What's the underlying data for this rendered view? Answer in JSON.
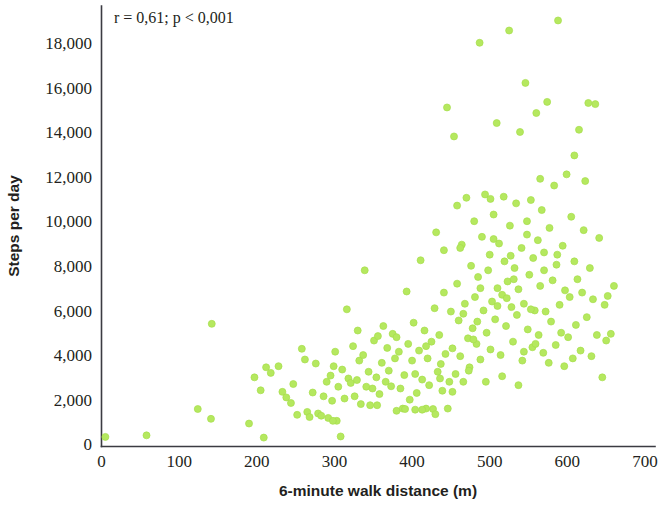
{
  "figure": {
    "background_color": "#ffffff",
    "point_color": "#b5e85f",
    "point_edge_color": "#a6de4b",
    "axis_color": "#3b3b42"
  },
  "annotation": {
    "text": "r = 0,61; p < 0,001"
  },
  "chart_data": {
    "type": "scatter",
    "title": "",
    "xlabel": "6-minute walk distance (m)",
    "ylabel": "Steps per day",
    "xlim": [
      0,
      700
    ],
    "ylim": [
      0,
      19600
    ],
    "xticks": [
      0,
      100,
      200,
      300,
      400,
      500,
      600,
      700
    ],
    "xtick_labels": [
      "0",
      "100",
      "200",
      "300",
      "400",
      "500",
      "600",
      "700"
    ],
    "yticks": [
      0,
      2000,
      4000,
      6000,
      8000,
      10000,
      12000,
      14000,
      16000,
      18000
    ],
    "ytick_labels": [
      "0",
      "2,000",
      "4,000",
      "6,000",
      "8,000",
      "10,000",
      "12,000",
      "14,000",
      "16,000",
      "18,000"
    ],
    "grid": false,
    "legend": false,
    "annotations": [
      {
        "text": "r = 0,61; p < 0,001",
        "x": 30,
        "y": 19200
      }
    ],
    "marker_size": 7,
    "series": [
      {
        "name": "participants",
        "color": "#b5e85f",
        "points": [
          [
            5,
            430
          ],
          [
            58,
            500
          ],
          [
            124,
            1680
          ],
          [
            141,
            1240
          ],
          [
            142,
            5500
          ],
          [
            190,
            1030
          ],
          [
            197,
            3100
          ],
          [
            205,
            2520
          ],
          [
            209,
            400
          ],
          [
            212,
            3550
          ],
          [
            218,
            3300
          ],
          [
            228,
            3600
          ],
          [
            233,
            2450
          ],
          [
            238,
            2200
          ],
          [
            244,
            1950
          ],
          [
            247,
            2800
          ],
          [
            252,
            1420
          ],
          [
            258,
            4380
          ],
          [
            262,
            3900
          ],
          [
            265,
            1550
          ],
          [
            268,
            1320
          ],
          [
            272,
            2420
          ],
          [
            276,
            3720
          ],
          [
            279,
            1480
          ],
          [
            283,
            1380
          ],
          [
            286,
            2250
          ],
          [
            290,
            2900
          ],
          [
            292,
            1280
          ],
          [
            295,
            3180
          ],
          [
            297,
            2050
          ],
          [
            299,
            3600
          ],
          [
            301,
            4250
          ],
          [
            303,
            1150
          ],
          [
            305,
            2680
          ],
          [
            308,
            450
          ],
          [
            310,
            3450
          ],
          [
            313,
            2150
          ],
          [
            316,
            6150
          ],
          [
            318,
            3050
          ],
          [
            321,
            2850
          ],
          [
            324,
            4500
          ],
          [
            326,
            2250
          ],
          [
            329,
            2980
          ],
          [
            332,
            3850
          ],
          [
            334,
            1900
          ],
          [
            337,
            4100
          ],
          [
            339,
            7900
          ],
          [
            341,
            2680
          ],
          [
            344,
            3350
          ],
          [
            346,
            1850
          ],
          [
            349,
            2600
          ],
          [
            351,
            4750
          ],
          [
            354,
            3100
          ],
          [
            356,
            4950
          ],
          [
            358,
            2350
          ],
          [
            361,
            3750
          ],
          [
            363,
            5400
          ],
          [
            366,
            2900
          ],
          [
            368,
            4420
          ],
          [
            370,
            3400
          ],
          [
            373,
            2700
          ],
          [
            375,
            5050
          ],
          [
            378,
            3950
          ],
          [
            380,
            1600
          ],
          [
            383,
            4250
          ],
          [
            385,
            2600
          ],
          [
            388,
            1700
          ],
          [
            390,
            3200
          ],
          [
            391,
            1680
          ],
          [
            393,
            6950
          ],
          [
            395,
            4600
          ],
          [
            397,
            2100
          ],
          [
            400,
            3850
          ],
          [
            402,
            5550
          ],
          [
            404,
            1650
          ],
          [
            406,
            2400
          ],
          [
            409,
            4300
          ],
          [
            411,
            8350
          ],
          [
            413,
            3000
          ],
          [
            416,
            5200
          ],
          [
            418,
            1700
          ],
          [
            420,
            3950
          ],
          [
            422,
            2750
          ],
          [
            425,
            4700
          ],
          [
            427,
            1680
          ],
          [
            429,
            6200
          ],
          [
            431,
            9600
          ],
          [
            433,
            3350
          ],
          [
            435,
            5000
          ],
          [
            437,
            3700
          ],
          [
            439,
            2500
          ],
          [
            441,
            8800
          ],
          [
            443,
            4150
          ],
          [
            445,
            15200
          ],
          [
            446,
            1700
          ],
          [
            448,
            2900
          ],
          [
            450,
            6050
          ],
          [
            452,
            4400
          ],
          [
            454,
            13900
          ],
          [
            456,
            3250
          ],
          [
            458,
            7300
          ],
          [
            460,
            5650
          ],
          [
            462,
            4050
          ],
          [
            464,
            9050
          ],
          [
            466,
            2900
          ],
          [
            468,
            6400
          ],
          [
            470,
            11150
          ],
          [
            472,
            4850
          ],
          [
            474,
            3550
          ],
          [
            476,
            8100
          ],
          [
            478,
            5300
          ],
          [
            480,
            10100
          ],
          [
            481,
            6700
          ],
          [
            483,
            4600
          ],
          [
            485,
            7600
          ],
          [
            487,
            18100
          ],
          [
            488,
            3900
          ],
          [
            490,
            9400
          ],
          [
            492,
            6100
          ],
          [
            494,
            11300
          ],
          [
            496,
            5100
          ],
          [
            498,
            7900
          ],
          [
            500,
            8600
          ],
          [
            501,
            4350
          ],
          [
            503,
            6500
          ],
          [
            505,
            10400
          ],
          [
            507,
            5700
          ],
          [
            509,
            14500
          ],
          [
            510,
            7100
          ],
          [
            512,
            9100
          ],
          [
            514,
            4100
          ],
          [
            516,
            6800
          ],
          [
            518,
            11200
          ],
          [
            519,
            8300
          ],
          [
            521,
            5400
          ],
          [
            523,
            7400
          ],
          [
            525,
            18650
          ],
          [
            526,
            9900
          ],
          [
            528,
            6250
          ],
          [
            530,
            4700
          ],
          [
            532,
            8000
          ],
          [
            534,
            10900
          ],
          [
            535,
            5900
          ],
          [
            537,
            7050
          ],
          [
            539,
            14100
          ],
          [
            541,
            8900
          ],
          [
            542,
            3850
          ],
          [
            544,
            6400
          ],
          [
            546,
            16300
          ],
          [
            548,
            9500
          ],
          [
            549,
            5250
          ],
          [
            551,
            7700
          ],
          [
            553,
            11050
          ],
          [
            555,
            4450
          ],
          [
            556,
            8450
          ],
          [
            558,
            6100
          ],
          [
            560,
            14950
          ],
          [
            562,
            9250
          ],
          [
            563,
            5000
          ],
          [
            565,
            7200
          ],
          [
            567,
            10600
          ],
          [
            569,
            4200
          ],
          [
            570,
            8700
          ],
          [
            572,
            6050
          ],
          [
            574,
            15450
          ],
          [
            576,
            3750
          ],
          [
            577,
            9800
          ],
          [
            579,
            5600
          ],
          [
            581,
            7450
          ],
          [
            583,
            11700
          ],
          [
            585,
            4550
          ],
          [
            586,
            8150
          ],
          [
            588,
            19100
          ],
          [
            590,
            6350
          ],
          [
            592,
            5100
          ],
          [
            594,
            9000
          ],
          [
            596,
            3600
          ],
          [
            597,
            7000
          ],
          [
            599,
            12200
          ],
          [
            601,
            4900
          ],
          [
            603,
            6700
          ],
          [
            605,
            10300
          ],
          [
            607,
            3950
          ],
          [
            609,
            8300
          ],
          [
            611,
            5450
          ],
          [
            613,
            7500
          ],
          [
            615,
            14200
          ],
          [
            617,
            4300
          ],
          [
            619,
            6900
          ],
          [
            621,
            9700
          ],
          [
            623,
            11900
          ],
          [
            625,
            5800
          ],
          [
            627,
            15400
          ],
          [
            629,
            8000
          ],
          [
            631,
            4050
          ],
          [
            633,
            6600
          ],
          [
            636,
            15350
          ],
          [
            638,
            5000
          ],
          [
            641,
            9350
          ],
          [
            645,
            3100
          ],
          [
            648,
            6350
          ],
          [
            650,
            4750
          ],
          [
            652,
            6750
          ],
          [
            656,
            5050
          ],
          [
            660,
            7200
          ],
          [
            380,
            4900
          ],
          [
            404,
            3250
          ],
          [
            355,
            1850
          ],
          [
            330,
            5200
          ],
          [
            298,
            1150
          ],
          [
            466,
            5950
          ],
          [
            488,
            7100
          ],
          [
            510,
            6300
          ],
          [
            531,
            7500
          ],
          [
            553,
            6150
          ],
          [
            441,
            6900
          ],
          [
            462,
            8900
          ],
          [
            484,
            5600
          ],
          [
            505,
            9300
          ],
          [
            527,
            8550
          ],
          [
            548,
            10100
          ],
          [
            570,
            7900
          ],
          [
            418,
            4500
          ],
          [
            436,
            3050
          ],
          [
            458,
            10800
          ],
          [
            479,
            4800
          ],
          [
            501,
            11100
          ],
          [
            522,
            6650
          ],
          [
            544,
            4250
          ],
          [
            565,
            12000
          ],
          [
            587,
            8600
          ],
          [
            609,
            13050
          ],
          [
            452,
            2450
          ],
          [
            473,
            3400
          ],
          [
            495,
            2900
          ],
          [
            516,
            3150
          ],
          [
            537,
            2750
          ],
          [
            559,
            4600
          ],
          [
            413,
            1650
          ],
          [
            430,
            1450
          ]
        ]
      }
    ]
  }
}
